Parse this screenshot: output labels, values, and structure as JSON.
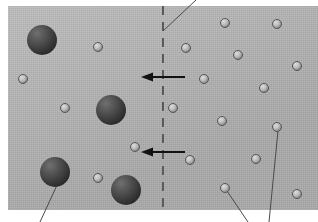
{
  "figure": {
    "panel": {
      "background_color": "#b5b5b5",
      "x": 8,
      "y": 6,
      "width": 310,
      "height": 204
    },
    "boundary": {
      "name": "dashed-boundary-line",
      "style": "dashed",
      "color": "#5a5a5a",
      "x": 163,
      "y_top": 6,
      "y_bottom": 210,
      "dash_length": 9,
      "gap_length": 7,
      "line_width": 2
    },
    "arrows": [
      {
        "label": "",
        "direction": "left",
        "x_start": 185,
        "x_end": 141,
        "y": 77,
        "color": "#111111"
      },
      {
        "label": "",
        "direction": "left",
        "x_start": 185,
        "x_end": 141,
        "y": 152,
        "color": "#111111"
      }
    ],
    "large_spheres": [
      {
        "cx": 42,
        "cy": 40,
        "r": 15,
        "color": "#454545"
      },
      {
        "cx": 111,
        "cy": 110,
        "r": 15,
        "color": "#454545"
      },
      {
        "cx": 55,
        "cy": 172,
        "r": 15,
        "color": "#454545"
      },
      {
        "cx": 126,
        "cy": 190,
        "r": 15,
        "color": "#454545"
      }
    ],
    "small_spheres": [
      {
        "cx": 98,
        "cy": 47,
        "r": 4.5,
        "color": "#c0c0c0"
      },
      {
        "cx": 23,
        "cy": 79,
        "r": 4.5,
        "color": "#c0c0c0"
      },
      {
        "cx": 65,
        "cy": 108,
        "r": 4.5,
        "color": "#c0c0c0"
      },
      {
        "cx": 135,
        "cy": 147,
        "r": 4.5,
        "color": "#c0c0c0"
      },
      {
        "cx": 98,
        "cy": 178,
        "r": 4.5,
        "color": "#c0c0c0"
      },
      {
        "cx": 186,
        "cy": 48,
        "r": 4.5,
        "color": "#c0c0c0"
      },
      {
        "cx": 204,
        "cy": 79,
        "r": 4.5,
        "color": "#c0c0c0"
      },
      {
        "cx": 225,
        "cy": 23,
        "r": 4.5,
        "color": "#c0c0c0"
      },
      {
        "cx": 238,
        "cy": 55,
        "r": 4.5,
        "color": "#c0c0c0"
      },
      {
        "cx": 277,
        "cy": 24,
        "r": 4.5,
        "color": "#c0c0c0"
      },
      {
        "cx": 297,
        "cy": 66,
        "r": 4.5,
        "color": "#c0c0c0"
      },
      {
        "cx": 264,
        "cy": 88,
        "r": 4.5,
        "color": "#c0c0c0"
      },
      {
        "cx": 222,
        "cy": 121,
        "r": 4.5,
        "color": "#c0c0c0"
      },
      {
        "cx": 190,
        "cy": 160,
        "r": 4.5,
        "color": "#c0c0c0"
      },
      {
        "cx": 225,
        "cy": 188,
        "r": 4.5,
        "color": "#c0c0c0"
      },
      {
        "cx": 277,
        "cy": 127,
        "r": 4.5,
        "color": "#c0c0c0"
      },
      {
        "cx": 256,
        "cy": 159,
        "r": 4.5,
        "color": "#c0c0c0"
      },
      {
        "cx": 297,
        "cy": 194,
        "r": 4.5,
        "color": "#c0c0c0"
      },
      {
        "cx": 173,
        "cy": 108,
        "r": 4.5,
        "color": "#c0c0c0"
      }
    ],
    "leader_lines": [
      {
        "name": "leader-boundary",
        "x1": 163,
        "y1": 31,
        "x2": 196,
        "y2": 0,
        "color": "#4a4a4a"
      },
      {
        "name": "leader-large-sphere",
        "x1": 58,
        "y1": 183,
        "x2": 40,
        "y2": 222,
        "color": "#4a4a4a"
      },
      {
        "name": "leader-small-sphere-a",
        "x1": 227,
        "y1": 191,
        "x2": 248,
        "y2": 222,
        "color": "#4a4a4a"
      },
      {
        "name": "leader-small-sphere-b",
        "x1": 278,
        "y1": 131,
        "x2": 269,
        "y2": 222,
        "color": "#4a4a4a"
      }
    ]
  }
}
